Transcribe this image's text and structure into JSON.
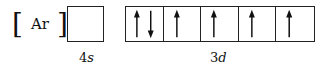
{
  "core": {
    "open_bracket": "[",
    "symbol": "Ar",
    "close_bracket": "]"
  },
  "orbitals": [
    {
      "name": "4s",
      "number": "4",
      "letter": "s",
      "boxes": [
        {
          "electrons": []
        }
      ]
    },
    {
      "name": "3d",
      "number": "3",
      "letter": "d",
      "boxes": [
        {
          "electrons": [
            "up",
            "down"
          ]
        },
        {
          "electrons": [
            "up"
          ]
        },
        {
          "electrons": [
            "up"
          ]
        },
        {
          "electrons": [
            "up"
          ]
        },
        {
          "electrons": [
            "up"
          ]
        }
      ]
    }
  ]
}
